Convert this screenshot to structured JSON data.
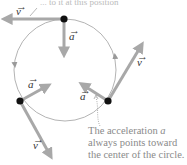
{
  "diagram": {
    "top_text_fragment": "... to it at this position",
    "circle": {
      "cx": 65,
      "cy": 70,
      "rx": 51,
      "ry": 51,
      "color": "#aaaaaa",
      "direction": "counterclockwise"
    },
    "colors": {
      "vector": "#a8a8a8",
      "point": "#111111",
      "caption": "#8a8a8a",
      "path": "#aaaaaa"
    },
    "labels": {
      "velocity": "v",
      "acceleration": "a",
      "vec_arrow": "→"
    },
    "points": [
      {
        "name": "top",
        "x": 64,
        "y": 19,
        "velocity_tip": [
          2,
          19
        ],
        "acceleration_tip": [
          64,
          57
        ]
      },
      {
        "name": "bottom-left",
        "x": 20,
        "y": 101,
        "velocity_tip": [
          52,
          158
        ],
        "acceleration_tip": [
          50,
          84
        ]
      },
      {
        "name": "right",
        "x": 108,
        "y": 101,
        "velocity_tip": [
          143,
          42
        ],
        "acceleration_tip": [
          80,
          83
        ]
      }
    ],
    "caption": {
      "lines": [
        "The acceleration",
        "always points toward",
        "the center of the circle."
      ],
      "vector_symbol": "a"
    }
  }
}
